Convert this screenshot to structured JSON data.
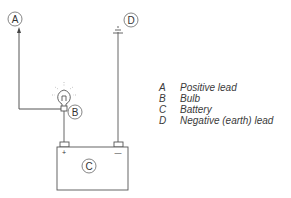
{
  "diagram": {
    "type": "battery-bulb-test-circuit",
    "labels": {
      "a": "A",
      "b": "B",
      "c": "C",
      "d": "D",
      "plus": "+",
      "minus": "—"
    }
  },
  "legend": {
    "items": [
      {
        "key": "A",
        "text": "Positive lead"
      },
      {
        "key": "B",
        "text": "Bulb"
      },
      {
        "key": "C",
        "text": "Battery"
      },
      {
        "key": "D",
        "text": "Negative (earth) lead"
      }
    ]
  },
  "colors": {
    "line": "#555555",
    "text": "#3a3a3a",
    "background": "#ffffff"
  }
}
